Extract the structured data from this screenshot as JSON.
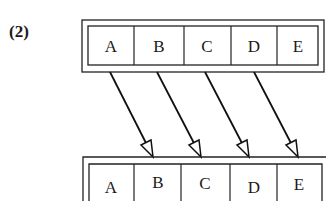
{
  "figure": {
    "label": "(2)",
    "top_array": {
      "cells": [
        "A",
        "B",
        "C",
        "D",
        "E"
      ]
    },
    "bottom_array": {
      "cells": [
        "A",
        "B",
        "C",
        "D",
        "E"
      ]
    },
    "arrows": [
      {
        "from": "A",
        "to": "B"
      },
      {
        "from": "B",
        "to": "C"
      },
      {
        "from": "C",
        "to": "D"
      },
      {
        "from": "D",
        "to": "E"
      }
    ]
  }
}
